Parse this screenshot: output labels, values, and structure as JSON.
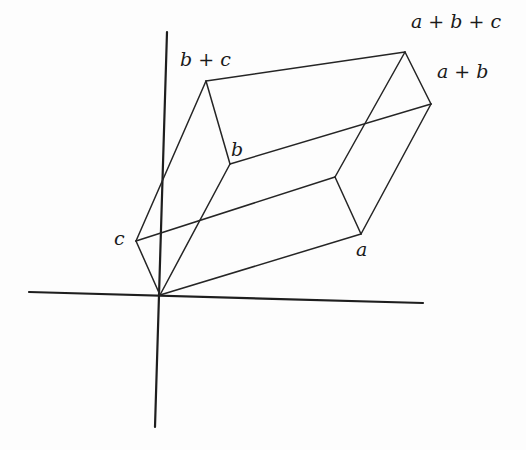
{
  "figure": {
    "type": "parallelepiped spanned by vectors a, b, c",
    "stroke_color": "#222222",
    "background": "#fdfdfd",
    "axes": [
      {
        "name": "vertical-axis",
        "from": [
          167,
          32
        ],
        "to": [
          155,
          427
        ]
      },
      {
        "name": "horizontal-axis",
        "from": [
          29,
          292
        ],
        "to": [
          423,
          303
        ]
      }
    ],
    "vertices": {
      "origin": [
        160,
        295
      ],
      "a": [
        361,
        234
      ],
      "b": [
        230,
        164
      ],
      "c": [
        136,
        241
      ],
      "a_plus_b": [
        431,
        104
      ],
      "b_plus_c": [
        206,
        81
      ],
      "a_plus_c": [
        335,
        177
      ],
      "a_plus_b_plus_c": [
        405,
        52
      ]
    },
    "edges": [
      [
        "origin",
        "a"
      ],
      [
        "origin",
        "b"
      ],
      [
        "origin",
        "c"
      ],
      [
        "a",
        "a_plus_b"
      ],
      [
        "a",
        "a_plus_c"
      ],
      [
        "b",
        "a_plus_b"
      ],
      [
        "b",
        "b_plus_c"
      ],
      [
        "c",
        "b_plus_c"
      ],
      [
        "c",
        "a_plus_c"
      ],
      [
        "a_plus_b",
        "a_plus_b_plus_c"
      ],
      [
        "b_plus_c",
        "a_plus_b_plus_c"
      ],
      [
        "a_plus_c",
        "a_plus_b_plus_c"
      ]
    ],
    "labels": {
      "a": "a",
      "b": "b",
      "c": "c",
      "a_plus_b": "a + b",
      "b_plus_c": "b + c",
      "a_plus_b_plus_c": "a + b + c"
    }
  }
}
